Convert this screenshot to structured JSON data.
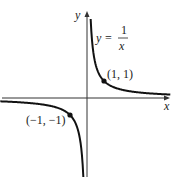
{
  "chart_data": {
    "type": "line",
    "title": "",
    "function_label": {
      "lhs": "y =",
      "numerator": "1",
      "denominator": "x"
    },
    "xlabel": "x",
    "ylabel": "y",
    "series": [
      {
        "name": "y = 1/x (x>0)",
        "x": [
          0.06,
          0.1,
          0.2,
          0.5,
          1,
          2,
          3,
          4,
          5
        ],
        "y": [
          16.7,
          10,
          5,
          2,
          1,
          0.5,
          0.33,
          0.25,
          0.2
        ]
      },
      {
        "name": "y = 1/x (x<0)",
        "x": [
          -5,
          -4,
          -3,
          -2,
          -1,
          -0.5,
          -0.2,
          -0.1,
          -0.06
        ],
        "y": [
          -0.2,
          -0.25,
          -0.33,
          -0.5,
          -1,
          -2,
          -5,
          -10,
          -16.7
        ]
      }
    ],
    "points": [
      {
        "x": 1,
        "y": 1,
        "label": "(1, 1)"
      },
      {
        "x": -1,
        "y": -1,
        "label": "(−1, −1)"
      }
    ],
    "grid": false,
    "legend": "none"
  }
}
